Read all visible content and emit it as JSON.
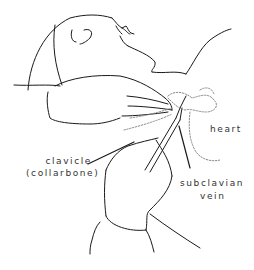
{
  "figure": {
    "colors": {
      "line": "#1a1a1a",
      "dotted": "#8a8a8a",
      "label": "#333333",
      "background": "#ffffff"
    }
  },
  "labels": {
    "heart": "heart",
    "clavicle_line1": "clavicle",
    "clavicle_line2": "(collarbone)",
    "subclavian_line1": "subclavian",
    "subclavian_line2": "vein"
  }
}
